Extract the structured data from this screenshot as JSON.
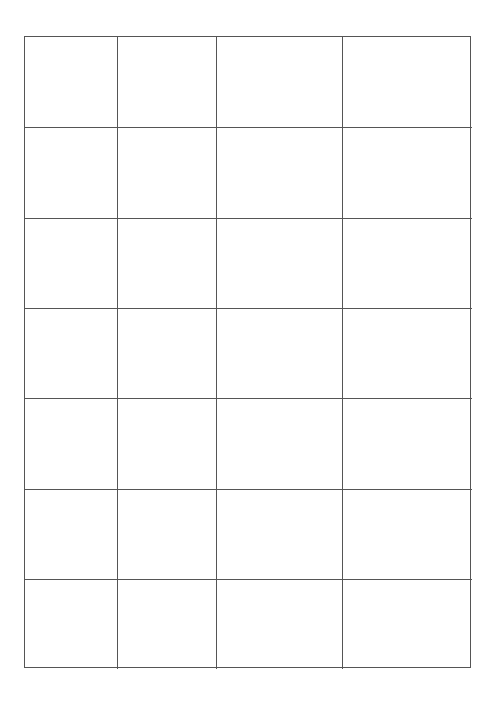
{
  "document": {
    "type": "blank-grid-table",
    "rows": 7,
    "columns": 4,
    "line_color": "#555555",
    "background": "#ffffff",
    "cells": [
      [
        "",
        "",
        "",
        ""
      ],
      [
        "",
        "",
        "",
        ""
      ],
      [
        "",
        "",
        "",
        ""
      ],
      [
        "",
        "",
        "",
        ""
      ],
      [
        "",
        "",
        "",
        ""
      ],
      [
        "",
        "",
        "",
        ""
      ],
      [
        "",
        "",
        "",
        ""
      ]
    ]
  }
}
